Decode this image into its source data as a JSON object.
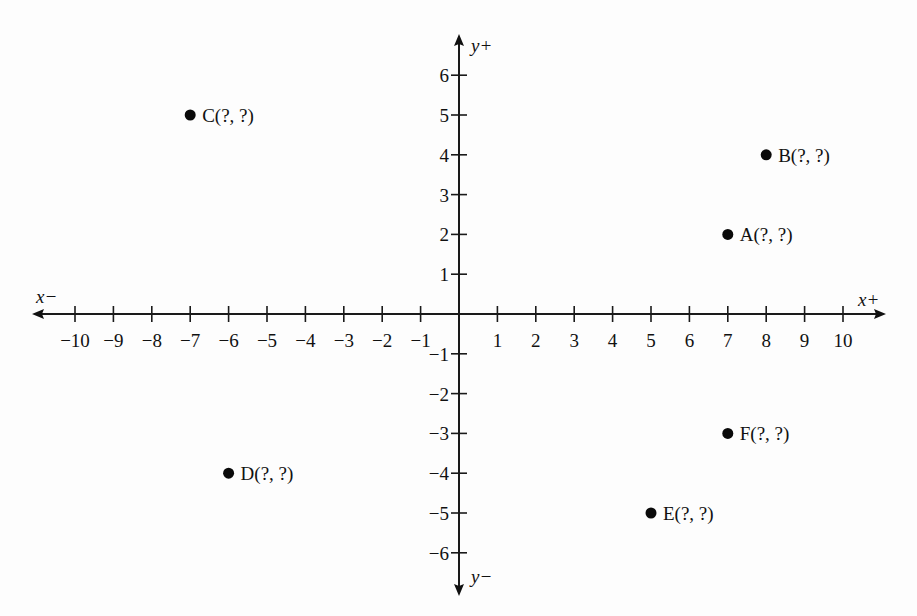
{
  "chart_data": {
    "type": "scatter",
    "title": "",
    "xlabel_positive": "x+",
    "xlabel_negative": "x−",
    "ylabel_positive": "y+",
    "ylabel_negative": "y−",
    "xlim": [
      -10,
      10
    ],
    "ylim": [
      -6,
      6
    ],
    "grid": false,
    "legend": null,
    "x_ticks": [
      -10,
      -9,
      -8,
      -7,
      -6,
      -5,
      -4,
      -3,
      -2,
      -1,
      1,
      2,
      3,
      4,
      5,
      6,
      7,
      8,
      9,
      10
    ],
    "y_ticks": [
      -6,
      -5,
      -4,
      -3,
      -2,
      -1,
      1,
      2,
      3,
      4,
      5,
      6
    ],
    "points": [
      {
        "name": "A",
        "label": "A(?, ?)",
        "x": 7,
        "y": 2
      },
      {
        "name": "B",
        "label": "B(?, ?)",
        "x": 8,
        "y": 4
      },
      {
        "name": "C",
        "label": "C(?, ?)",
        "x": -7,
        "y": 5
      },
      {
        "name": "D",
        "label": "D(?, ?)",
        "x": -6,
        "y": -4
      },
      {
        "name": "E",
        "label": "E(?, ?)",
        "x": 5,
        "y": -5
      },
      {
        "name": "F",
        "label": "F(?, ?)",
        "x": 7,
        "y": -3
      }
    ]
  },
  "colors": {
    "ink": "#111111",
    "background": "#fdfdfd"
  }
}
